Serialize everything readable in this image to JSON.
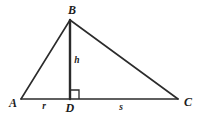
{
  "figure": {
    "background_color": "#ffffff",
    "stroke_color": "#2b2b2b",
    "width": 199,
    "height": 128,
    "vertices": {
      "A": {
        "label": "A",
        "x": 21,
        "y": 99,
        "label_x": 13,
        "label_y": 103
      },
      "B": {
        "label": "B",
        "x": 70,
        "y": 20,
        "label_x": 72,
        "label_y": 10
      },
      "C": {
        "label": "C",
        "x": 178,
        "y": 99,
        "label_x": 188,
        "label_y": 102
      },
      "D": {
        "label": "D",
        "x": 70,
        "y": 99,
        "label_x": 70,
        "label_y": 108
      }
    },
    "segments": [
      {
        "name": "side-AB",
        "from": "A",
        "to": "B",
        "x1": 21,
        "y1": 99,
        "x2": 70,
        "y2": 20,
        "width": 1.6
      },
      {
        "name": "side-BC",
        "from": "B",
        "to": "C",
        "x1": 70,
        "y1": 20,
        "x2": 178,
        "y2": 99,
        "width": 1.6
      },
      {
        "name": "side-AC",
        "from": "A",
        "to": "C",
        "x1": 21,
        "y1": 99,
        "x2": 178,
        "y2": 99,
        "width": 1.6
      },
      {
        "name": "altitude-BD",
        "from": "B",
        "to": "D",
        "x1": 70,
        "y1": 20,
        "x2": 70,
        "y2": 99,
        "width": 2.4
      }
    ],
    "measure_labels": {
      "altitude": {
        "label": "h",
        "x": 77,
        "y": 61
      },
      "left_base": {
        "label": "r",
        "x": 44,
        "y": 107
      },
      "right_base": {
        "label": "s",
        "x": 121,
        "y": 108
      }
    },
    "right_angle_mark": {
      "name": "right-angle-at-D",
      "vertex_x": 70,
      "vertex_y": 99,
      "size": 9,
      "direction": "right",
      "width": 1.3
    }
  }
}
